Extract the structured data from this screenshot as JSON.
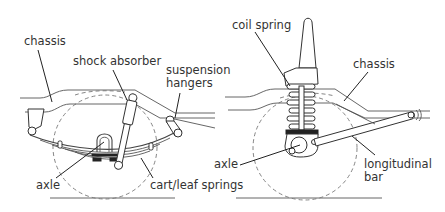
{
  "left_diagram": {
    "labels": {
      "chassis": "chassis",
      "shock_absorber": "shock absorber",
      "suspension_hangers_line1": "suspension",
      "suspension_hangers_line2": "hangers",
      "axle": "axle",
      "cart_leaf_springs": "cart/leaf springs"
    }
  },
  "right_diagram": {
    "labels": {
      "coil_spring": "coil spring",
      "chassis": "chassis",
      "axle": "axle",
      "longitudinal_bar_line1": "longitudinal",
      "longitudinal_bar_line2": "bar"
    }
  }
}
